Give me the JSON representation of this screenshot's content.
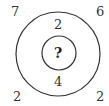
{
  "puzzle": {
    "corners": {
      "top_left": "7",
      "top_right": "6",
      "bottom_left": "2",
      "bottom_right": "2"
    },
    "ring": {
      "top": "2",
      "bottom": "4"
    },
    "center": "?"
  }
}
